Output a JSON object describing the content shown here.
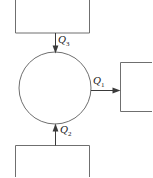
{
  "diagram": {
    "colors": {
      "outline": "#6f6f6f",
      "arrow": "#3a3a3a",
      "background": "#ffffff",
      "text": "#1a1a1a"
    },
    "system": {
      "shape": "circle",
      "label": "",
      "center_x": 55,
      "center_y": 88,
      "radius": 36
    },
    "reservoirs": [
      {
        "name": "top-reservoir",
        "shape": "open-top-rectangle",
        "x": 15,
        "y": 0,
        "width": 75,
        "height": 33,
        "label": ""
      },
      {
        "name": "right-reservoir",
        "shape": "open-right-rectangle",
        "x": 120,
        "y": 62,
        "width": 32,
        "height": 50,
        "label": ""
      },
      {
        "name": "bottom-reservoir",
        "shape": "open-bottom-rectangle",
        "x": 15,
        "y": 145,
        "width": 75,
        "height": 32,
        "label": ""
      }
    ],
    "flows": [
      {
        "name": "heat-flow-top",
        "label_text": "Q",
        "subscript": "3",
        "direction": "into-system",
        "orientation": "vertical-down"
      },
      {
        "name": "heat-flow-right",
        "label_text": "Q",
        "subscript": "1",
        "direction": "out-of-system",
        "orientation": "horizontal-right"
      },
      {
        "name": "heat-flow-bottom",
        "label_text": "Q",
        "subscript": "2",
        "direction": "into-system",
        "orientation": "vertical-up"
      }
    ]
  }
}
